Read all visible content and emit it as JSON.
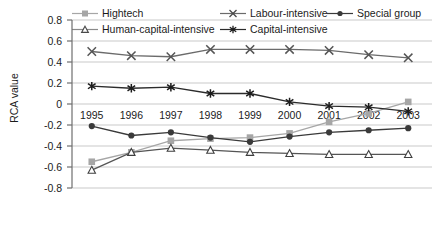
{
  "chart_data": {
    "type": "line",
    "title": "",
    "xlabel": "",
    "ylabel": "RCA value",
    "categories": [
      "1995",
      "1996",
      "1997",
      "1998",
      "1999",
      "2000",
      "2001",
      "2002",
      "2003"
    ],
    "ylim": [
      -0.8,
      0.8
    ],
    "ytick_labels": [
      "0.8",
      "0.6",
      "0.4",
      "0.2",
      "0",
      "-0.2",
      "-0.4",
      "-0.6",
      "-0.8"
    ],
    "ytick_values": [
      0.8,
      0.6,
      0.4,
      0.2,
      0,
      -0.2,
      -0.4,
      -0.6,
      -0.8
    ],
    "grid": true,
    "legend_position": "top",
    "series": [
      {
        "name": "Hightech",
        "marker": "square-filled",
        "color": "#a6a6a6",
        "values": [
          -0.55,
          -0.46,
          -0.35,
          -0.33,
          -0.32,
          -0.28,
          -0.17,
          -0.09,
          0.02
        ]
      },
      {
        "name": "Human-capital-intensive",
        "marker": "triangle-open",
        "color": "#555555",
        "values": [
          -0.63,
          -0.46,
          -0.42,
          -0.44,
          -0.46,
          -0.47,
          -0.48,
          -0.48,
          -0.48
        ]
      },
      {
        "name": "Labour-intensive",
        "marker": "x-cross",
        "color": "#6b6b6b",
        "values": [
          0.5,
          0.46,
          0.45,
          0.52,
          0.52,
          0.52,
          0.51,
          0.47,
          0.44
        ]
      },
      {
        "name": "Capital-intensive",
        "marker": "asterisk",
        "color": "#2b2b2b",
        "values": [
          0.17,
          0.15,
          0.16,
          0.1,
          0.1,
          0.02,
          -0.02,
          -0.03,
          -0.07
        ]
      },
      {
        "name": "Special group",
        "marker": "circle-filled",
        "color": "#3a3a3a",
        "values": [
          -0.21,
          -0.3,
          -0.27,
          -0.32,
          -0.36,
          -0.31,
          -0.27,
          -0.25,
          -0.23
        ]
      }
    ]
  },
  "axes": {
    "grid_color": "#c9c9c9",
    "axis_color": "#6e6e6e"
  }
}
